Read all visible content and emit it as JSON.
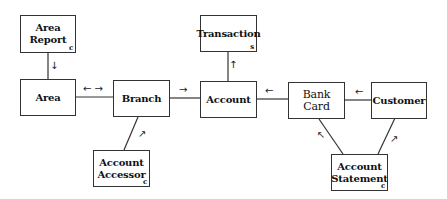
{
  "diagram": {
    "nodes": [
      {
        "id": "area_report",
        "label_line1": "Area",
        "label_line2": "Report",
        "tag": "c"
      },
      {
        "id": "area",
        "label": "Area"
      },
      {
        "id": "branch",
        "label": "Branch"
      },
      {
        "id": "account",
        "label": "Account"
      },
      {
        "id": "transaction",
        "label": "Transaction",
        "tag": "s"
      },
      {
        "id": "bank_card",
        "label": "Bank Card"
      },
      {
        "id": "customer",
        "label": "Customer"
      },
      {
        "id": "account_accessor",
        "label_line1": "Account",
        "label_line2": "Accessor",
        "tag": "c"
      },
      {
        "id": "account_statement",
        "label_line1": "Account",
        "label_line2": "Statement",
        "tag": "c"
      }
    ],
    "edges": [
      {
        "from": "area_report",
        "to": "area",
        "arrow": "↓"
      },
      {
        "from": "area",
        "to": "branch",
        "arrow": "← →"
      },
      {
        "from": "branch",
        "to": "account",
        "arrow": "→"
      },
      {
        "from": "account",
        "to": "transaction",
        "arrow": "↑"
      },
      {
        "from": "bank_card",
        "to": "account",
        "arrow": "←"
      },
      {
        "from": "customer",
        "to": "bank_card",
        "arrow": "←"
      },
      {
        "from": "account_accessor",
        "to": "branch",
        "arrow": "↗"
      },
      {
        "from": "account_statement",
        "to": "bank_card",
        "arrow": "↖"
      },
      {
        "from": "account_statement",
        "to": "customer",
        "arrow": "↗"
      }
    ]
  }
}
